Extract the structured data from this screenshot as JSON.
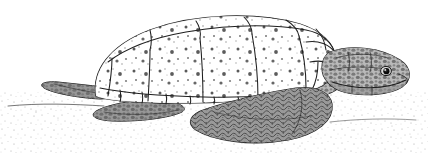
{
  "figure": {
    "kind": "scientific-illustration",
    "medium": "pen-and-ink stipple drawing",
    "orientation": "facing right",
    "background_color": "#ffffff",
    "ink_color": "#1a1a1a",
    "canvas": {
      "width": 428,
      "height": 163
    },
    "caption": "",
    "palette": {
      "outline": "#1a1a1a",
      "carapace_fill": "#ffffff",
      "carapace_speckle": "#2b2b2b",
      "skin_dark": "#6a6a6a",
      "skin_shadow": "#3d3d3d",
      "sand_stipple": "#8c8c8c",
      "eye": "#101010"
    }
  },
  "subject": {
    "common_name": "Sea turtle",
    "parts": [
      {
        "name": "carapace",
        "label": "Carapace (upper shell)",
        "note": "high-domed, speckled, divided into scutes"
      },
      {
        "name": "vertebral-scutes",
        "label": "Vertebral scutes",
        "count": 5,
        "note": "row along top ridge"
      },
      {
        "name": "costal-scutes",
        "label": "Costal scutes",
        "count": 5,
        "note": "large side panels"
      },
      {
        "name": "marginal-scutes",
        "label": "Marginal scutes",
        "count": 11,
        "note": "small row along lower shell rim"
      },
      {
        "name": "nuchal-scutes",
        "label": "Nuchal scutes",
        "note": "small plates at front of shell above neck"
      },
      {
        "name": "head",
        "label": "Head",
        "note": "large blocky head with granular scales"
      },
      {
        "name": "eye",
        "label": "Eye",
        "note": "dark round eye with pale highlight"
      },
      {
        "name": "beak",
        "label": "Horny beak",
        "note": "hooked upper jaw"
      },
      {
        "name": "neck",
        "label": "Neck",
        "note": "thick, covered in small tubercles"
      },
      {
        "name": "front-flipper",
        "label": "Front flipper",
        "note": "broad paddle with scale mosaic, resting on sand"
      },
      {
        "name": "rear-flipper",
        "label": "Rear flipper",
        "note": "short dark paddle at left"
      },
      {
        "name": "ground",
        "label": "Sand",
        "note": "stippled beach surface under the animal"
      }
    ]
  },
  "annotations": {
    "visible_text": [],
    "labels_shown": false,
    "scale_bar_shown": false,
    "border_shown": false
  }
}
